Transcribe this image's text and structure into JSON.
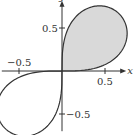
{
  "figure": {
    "curve": "lemniscate r^2 = a^2 sin(2θ)",
    "curve_scale_a": 0.94,
    "shaded_region": "first-quadrant loop",
    "colors": {
      "curve": "#333333",
      "axis": "#333333",
      "shade": "#d9d9d9"
    },
    "axes": {
      "x_label": "x",
      "y_label": "y",
      "x_ticks": [
        {
          "value": -0.5,
          "label": "−0.5"
        },
        {
          "value": 0.5,
          "label": "0.5"
        }
      ],
      "y_ticks": [
        {
          "value": 0.5,
          "label": "0.5"
        },
        {
          "value": -0.5,
          "label": "−0.5"
        }
      ],
      "x_range": [
        -0.7,
        0.7
      ],
      "y_range": [
        -0.7,
        0.77
      ]
    },
    "layout": {
      "origin_px": [
        62,
        71
      ],
      "px_per_unit": 86
    }
  }
}
